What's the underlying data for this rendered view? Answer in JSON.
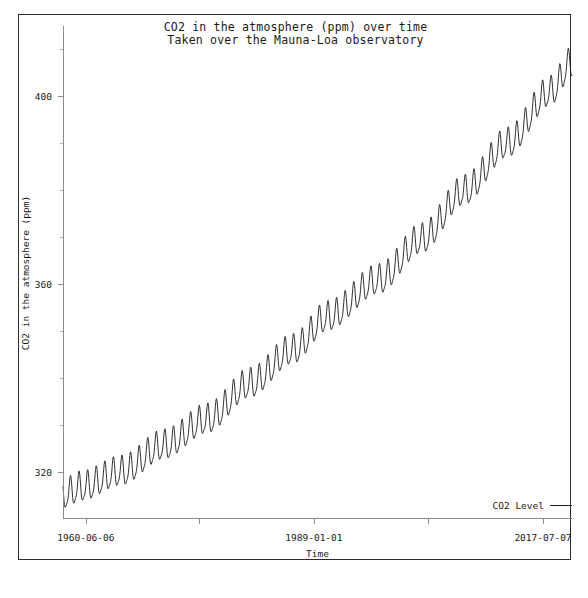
{
  "chart_data": {
    "type": "line",
    "title": "CO2 in the atmosphere (ppm) over time",
    "subtitle": "Taken over the Mauna-Loa observatory",
    "xlabel": "Time",
    "ylabel": "CO2 in the atmosphere (ppm)",
    "grid": false,
    "legend_position": "bottom-right",
    "legend": [
      "CO2 Level"
    ],
    "series_name": "CO2 Level",
    "series_color": "#1a1a1a",
    "x_range": [
      "1958-03-01",
      "2017-07-07"
    ],
    "x_tick_labels": [
      "1960-06-06",
      "",
      "1989-01-01",
      "",
      "2017-07-07"
    ],
    "x_tick_positions_frac": [
      0.045,
      0.268,
      0.493,
      0.718,
      0.943
    ],
    "ylim": [
      310,
      415
    ],
    "y_ticks_major": [
      320,
      360,
      400
    ],
    "y_ticks_minor": [
      330,
      340,
      350,
      370,
      380,
      390,
      410
    ],
    "seasonal_amplitude_ppm": 3.0,
    "seasonal_period_years": 1.0,
    "annotation": "Keeling curve: monthly mean atmospheric CO2 with annual seasonal cycle on a rising trend",
    "trend_anchor_points": [
      {
        "year": 1958.2,
        "ppm": 315.0
      },
      {
        "year": 1960.4,
        "ppm": 316.6
      },
      {
        "year": 1965.0,
        "ppm": 319.9
      },
      {
        "year": 1970.0,
        "ppm": 325.5
      },
      {
        "year": 1975.0,
        "ppm": 331.0
      },
      {
        "year": 1980.0,
        "ppm": 338.6
      },
      {
        "year": 1985.0,
        "ppm": 345.8
      },
      {
        "year": 1989.0,
        "ppm": 352.8
      },
      {
        "year": 1995.0,
        "ppm": 360.7
      },
      {
        "year": 2000.0,
        "ppm": 369.4
      },
      {
        "year": 2005.0,
        "ppm": 379.7
      },
      {
        "year": 2010.0,
        "ppm": 389.8
      },
      {
        "year": 2015.0,
        "ppm": 400.8
      },
      {
        "year": 2017.5,
        "ppm": 407.0
      }
    ]
  }
}
